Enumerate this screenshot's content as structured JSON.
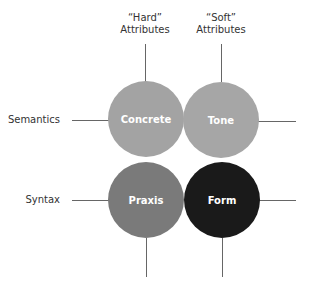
{
  "columns": [
    {
      "line1": "“Hard”",
      "line2": "Attributes"
    },
    {
      "line1": "“Soft”",
      "line2": "Attributes"
    }
  ],
  "rows": [
    {
      "label": "Semantics"
    },
    {
      "label": "Syntax"
    }
  ],
  "cells": [
    {
      "label": "Concrete",
      "color": "#a3a3a3"
    },
    {
      "label": "Tone",
      "color": "#a6a6a6"
    },
    {
      "label": "Praxis",
      "color": "#7a7a7a"
    },
    {
      "label": "Form",
      "color": "#1a1a1a"
    }
  ]
}
